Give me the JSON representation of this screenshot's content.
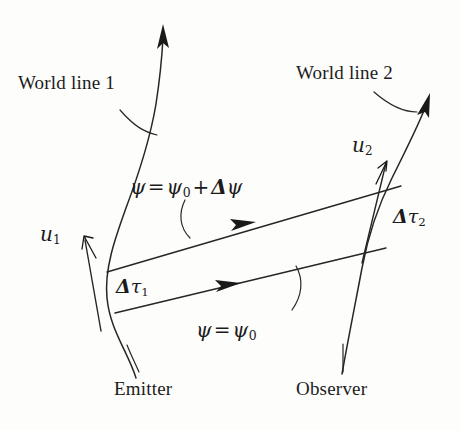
{
  "figure": {
    "kind": "spacetime-diagram",
    "background_color": "#fdfdfb",
    "ink_color": "#262626"
  },
  "labels": {
    "worldline1": "World line 1",
    "worldline2": "World line 2",
    "emitter": "Emitter",
    "observer": "Observer"
  },
  "math": {
    "psi_upper": {
      "lhs": "ψ",
      "eq": "=",
      "rhs_symbol": "ψ",
      "rhs_sub": "0",
      "plus": "+",
      "delta": "Δ",
      "delta_symbol": "ψ"
    },
    "psi_lower": {
      "lhs": "ψ",
      "eq": "=",
      "rhs_symbol": "ψ",
      "rhs_sub": "0"
    },
    "u1": {
      "symbol": "u",
      "sub": "1"
    },
    "u2": {
      "symbol": "u",
      "sub": "2"
    },
    "dtau1": {
      "delta": "Δ",
      "symbol": "τ",
      "sub": "1"
    },
    "dtau2": {
      "delta": "Δ",
      "symbol": "τ",
      "sub": "2"
    }
  },
  "geometry": {
    "worldline1": {
      "name": "emitter-world-line",
      "path": "M 136 378 C 128 352 110 330 107 298 C 104 268 116 236 126 208 C 138 176 150 140 156 104 C 160 78 162 56 163 38",
      "arrow_tip": [
        163,
        26
      ],
      "arrow_angle_deg": -86
    },
    "worldline2": {
      "name": "observer-world-line",
      "path": "M 342 374 C 348 340 356 300 362 268 C 368 236 378 206 392 178 C 406 150 418 126 425 108",
      "arrow_tip": [
        429,
        96
      ],
      "arrow_angle_deg": -68
    },
    "ray_upper": {
      "name": "null-ray-upper",
      "from": [
        107,
        272
      ],
      "to": [
        401,
        186
      ],
      "arrow_at": [
        243,
        226
      ]
    },
    "ray_lower": {
      "name": "null-ray-lower",
      "from": [
        115,
        313
      ],
      "to": [
        386,
        248
      ],
      "arrow_at": [
        228,
        286
      ]
    },
    "u1_vector": {
      "from": [
        101,
        331
      ],
      "to": [
        84,
        238
      ]
    },
    "u2_vector": {
      "from": [
        362,
        263
      ],
      "to": [
        386,
        161
      ]
    },
    "leader_worldline1": "M 120 110 C 134 126 144 132 157 135",
    "leader_worldline2": "M 374 92 C 390 106 404 112 417 112",
    "leader_psi_upper": "M 185 200 C 178 214 180 228 190 238",
    "leader_psi_lower": "M 296 266 C 304 280 302 296 292 310",
    "leader_emitter": "M 127 345 C 131 355 135 363 139 372",
    "leader_observer": "M 343 344 C 343 356 343 364 343 372"
  }
}
